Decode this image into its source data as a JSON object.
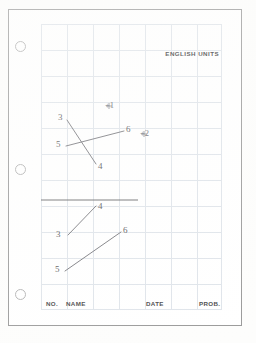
{
  "sheet": {
    "title": "Engineering graph paper worksheet",
    "header_label": "ENGLISH UNITS",
    "background_color": "#ffffff",
    "border_color": "#9a9a9a",
    "grid_color": "#dfe4ea",
    "ink_color": "#6b6b70"
  },
  "punch_holes": [
    {
      "name": "punch-hole-top",
      "cx": 19,
      "cy": 45
    },
    {
      "name": "punch-hole-middle",
      "cx": 19,
      "cy": 168
    },
    {
      "name": "punch-hole-bottom",
      "cx": 19,
      "cy": 293
    }
  ],
  "grid": {
    "left": 41,
    "top": 24,
    "width": 181,
    "height": 286,
    "cell_size": 26,
    "columns": 7,
    "rows": 11
  },
  "footer": {
    "fields": [
      {
        "label": "NO.",
        "x": 46,
        "y": 303
      },
      {
        "label": "NAME",
        "x": 66,
        "y": 303
      },
      {
        "label": "DATE",
        "x": 146,
        "y": 303
      },
      {
        "label": "PROB.",
        "x": 199,
        "y": 303
      }
    ]
  },
  "figures": [
    {
      "name": "upper-figure",
      "description": "Two crossing straight lines with numbered endpoints and two plus marks",
      "segments": [
        {
          "name": "segment-3-4",
          "x1": 67,
          "y1": 120,
          "x2": 96,
          "y2": 164
        },
        {
          "name": "segment-5-6",
          "x1": 66,
          "y1": 146,
          "x2": 124,
          "y2": 131
        }
      ],
      "labels": [
        {
          "text": "3",
          "x": 58,
          "y": 113
        },
        {
          "text": "5",
          "x": 56,
          "y": 140
        },
        {
          "text": "6",
          "x": 126,
          "y": 126
        },
        {
          "text": "4",
          "x": 99,
          "y": 163
        }
      ],
      "plus_marks": [
        {
          "text": "+1",
          "x": 108,
          "y": 103
        },
        {
          "text": "+2",
          "x": 143,
          "y": 130
        }
      ]
    },
    {
      "name": "separator-line",
      "description": "Horizontal datum line dividing the two figures",
      "x1": 41,
      "y1": 200,
      "x2": 138,
      "y2": 200
    },
    {
      "name": "lower-figure",
      "description": "Two parallel straight lines with numbered endpoints",
      "segments": [
        {
          "name": "segment-3-4",
          "x1": 68,
          "y1": 235,
          "x2": 96,
          "y2": 206
        },
        {
          "name": "segment-5-6",
          "x1": 65,
          "y1": 271,
          "x2": 121,
          "y2": 232
        }
      ],
      "labels": [
        {
          "text": "4",
          "x": 98,
          "y": 204
        },
        {
          "text": "3",
          "x": 57,
          "y": 231
        },
        {
          "text": "6",
          "x": 123,
          "y": 228
        },
        {
          "text": "5",
          "x": 55,
          "y": 267
        }
      ]
    }
  ]
}
